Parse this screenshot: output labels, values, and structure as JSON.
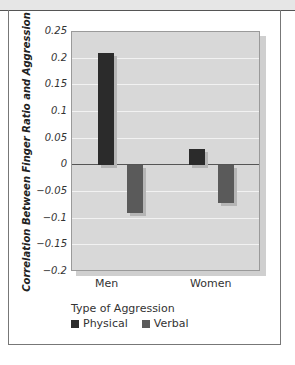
{
  "chart_data": {
    "type": "bar",
    "title": "",
    "xlabel": "",
    "ylabel": "Correlation Between Finger Ratio and Aggression",
    "categories": [
      "Men",
      "Women"
    ],
    "series": [
      {
        "name": "Physical",
        "values": [
          0.21,
          0.03
        ],
        "color": "#2b2b2b"
      },
      {
        "name": "Verbal",
        "values": [
          -0.09,
          -0.07
        ],
        "color": "#5a5a5a"
      }
    ],
    "ylim": [
      -0.2,
      0.25
    ],
    "yticks": [
      "0.25",
      "0.2",
      "0.15",
      "0.1",
      "0.05",
      "0",
      "-0.05",
      "-0.1",
      "-0.15",
      "-0.2"
    ],
    "grid": true,
    "legend_title": "Type of Aggression",
    "legend_position": "bottom-left"
  },
  "axis": {
    "ylabel": "Correlation Between Finger Ratio and Aggression",
    "yticks": [
      "0.25",
      "0.2",
      "0.15",
      "0.1",
      "0.05",
      "0",
      "−0.05",
      "−0.1",
      "−0.15",
      "−0.2"
    ]
  },
  "categories": [
    "Men",
    "Women"
  ],
  "legend": {
    "title": "Type of Aggression",
    "items": [
      {
        "label": "Physical",
        "color": "#2b2b2b"
      },
      {
        "label": "Verbal",
        "color": "#5a5a5a"
      }
    ]
  }
}
